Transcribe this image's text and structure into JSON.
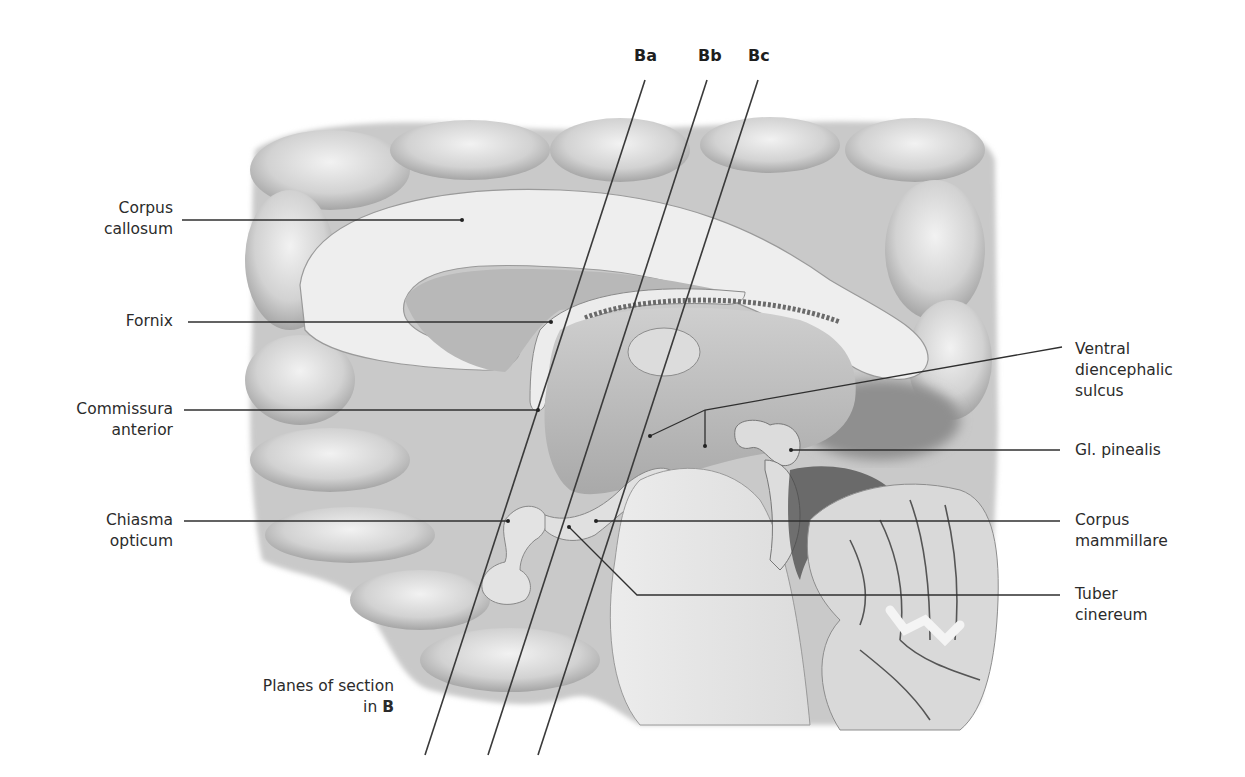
{
  "figure": {
    "type": "anatomical-illustration",
    "colors": {
      "background": "#ffffff",
      "cortex_light": "#e6e6e6",
      "cortex_mid": "#bdbdbd",
      "cortex_dark": "#6e6e6e",
      "white_matter": "#ededed",
      "leader_line": "#2f2f2f",
      "text": "#2b2b2b"
    }
  },
  "section_planes": [
    {
      "id": "Ba",
      "label": "Ba",
      "x1": 645,
      "y1": 80,
      "x2": 425,
      "y2": 755
    },
    {
      "id": "Bb",
      "label": "Bb",
      "x1": 707,
      "y1": 80,
      "x2": 488,
      "y2": 755
    },
    {
      "id": "Bc",
      "label": "Bc",
      "x1": 758,
      "y1": 80,
      "x2": 538,
      "y2": 755
    }
  ],
  "planes_caption": {
    "line1": "Planes of section",
    "line2_prefix": "in ",
    "line2_bold": "B"
  },
  "labels_left": [
    {
      "id": "corpus-callosum",
      "lines": [
        "Corpus",
        "callosum"
      ]
    },
    {
      "id": "fornix",
      "lines": [
        "Fornix"
      ]
    },
    {
      "id": "commissura-anterior",
      "lines": [
        "Commissura",
        "anterior"
      ]
    },
    {
      "id": "chiasma-opticum",
      "lines": [
        "Chiasma",
        "opticum"
      ]
    }
  ],
  "labels_right": [
    {
      "id": "ventral-diencephalic-sulcus",
      "lines": [
        "Ventral",
        "diencephalic",
        "sulcus"
      ]
    },
    {
      "id": "gl-pinealis",
      "lines": [
        "Gl. pinealis"
      ]
    },
    {
      "id": "corpus-mammillare",
      "lines": [
        "Corpus",
        "mammillare"
      ]
    },
    {
      "id": "tuber-cinereum",
      "lines": [
        "Tuber",
        "cinereum"
      ]
    }
  ]
}
